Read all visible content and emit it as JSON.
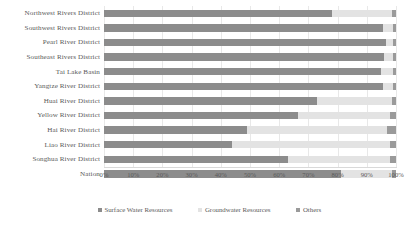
{
  "chart_data": {
    "type": "bar",
    "orientation": "horizontal",
    "stacked": true,
    "normalized": true,
    "title": "",
    "xlabel": "",
    "ylabel": "",
    "xlim": [
      0,
      100
    ],
    "grid": true,
    "legend_position": "bottom",
    "xticks": [
      "0%",
      "10%",
      "20%",
      "30%",
      "40%",
      "50%",
      "60%",
      "70%",
      "80%",
      "90%",
      "100%"
    ],
    "xtick_values": [
      0,
      10,
      20,
      30,
      40,
      50,
      60,
      70,
      80,
      90,
      100
    ],
    "categories": [
      "Northwest Rivers District",
      "Southwest Rivers District",
      "Pearl River District",
      "Southeast Rivers District",
      "Tai Lake Basin",
      "Yangtze River District",
      "Huai River District",
      "Yellow River District",
      "Hai River District",
      "Liao River District",
      "Songhua River District",
      "Nation"
    ],
    "series": [
      {
        "name": "Surface Water Resources",
        "color": "#8c8c8c",
        "values": [
          78.0,
          95.5,
          96.5,
          96.0,
          95.0,
          95.5,
          73.0,
          66.5,
          49.0,
          44.0,
          63.0,
          81.0
        ]
      },
      {
        "name": "Groundwater Resources",
        "color": "#e3e3e3",
        "values": [
          20.6,
          3.4,
          2.5,
          3.0,
          4.0,
          3.5,
          25.6,
          31.5,
          48.0,
          54.0,
          35.0,
          17.6
        ]
      },
      {
        "name": "Others",
        "color": "#9a9a9a",
        "values": [
          1.4,
          1.1,
          1.0,
          1.0,
          1.0,
          1.0,
          1.4,
          2.0,
          3.0,
          2.0,
          2.0,
          1.4
        ]
      }
    ]
  },
  "legend": {
    "items": [
      {
        "label": "Surface Water Resources",
        "color": "#8c8c8c"
      },
      {
        "label": "Groundwater Resources",
        "color": "#e3e3e3"
      },
      {
        "label": "Others",
        "color": "#9a9a9a"
      }
    ]
  }
}
